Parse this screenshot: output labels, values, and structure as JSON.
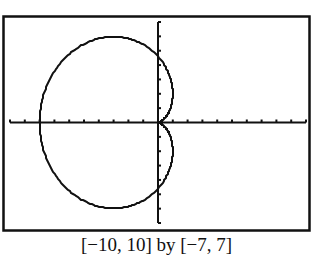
{
  "chart_data": {
    "type": "line",
    "title": "",
    "xlabel": "",
    "ylabel": "",
    "xlim": [
      -10,
      10
    ],
    "ylim": [
      -7,
      7
    ],
    "xscale_tick": 1,
    "yscale_tick": 1,
    "grid": false,
    "legend": null,
    "series": [
      {
        "name": "limacon",
        "approx_features": {
          "leftmost_x": -8,
          "top_y": 5,
          "bottom_y": -5,
          "y_axis_crossings": [
            4,
            -4
          ],
          "inner_loop_rightmost_x": 1
        }
      }
    ],
    "window_caption": "[−10, 10] by [−7, 7]"
  },
  "caption": "[−10, 10] by [−7, 7]",
  "colors": {
    "ink": "#111111",
    "background": "#ffffff"
  }
}
